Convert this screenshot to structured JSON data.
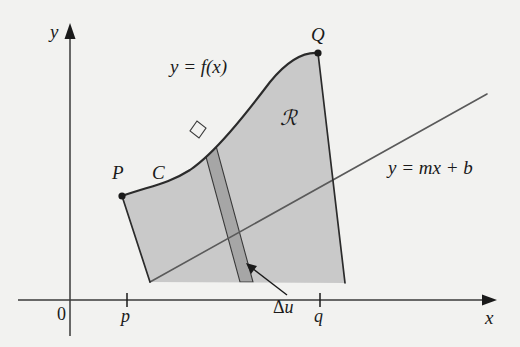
{
  "figure": {
    "background_color": "#f2f2f0",
    "ink_color": "#1a1a1a",
    "region_fill_color": "#c9c9c9",
    "strip_fill_color": "#a6a6a6"
  },
  "axes": {
    "y_label": "y",
    "x_label": "x",
    "origin_label": "0",
    "ticks": [
      {
        "name": "p",
        "label": "p"
      },
      {
        "name": "q",
        "label": "q"
      }
    ]
  },
  "points": [
    {
      "name": "P",
      "label": "P"
    },
    {
      "name": "Q",
      "label": "Q"
    }
  ],
  "curves": [
    {
      "name": "C",
      "label": "C"
    }
  ],
  "labels": {
    "function_equation": "y = f(x)",
    "line_equation": "y = mx + b",
    "region": "ℛ",
    "strip_width_delta": "Δ",
    "strip_width_var": "u"
  }
}
